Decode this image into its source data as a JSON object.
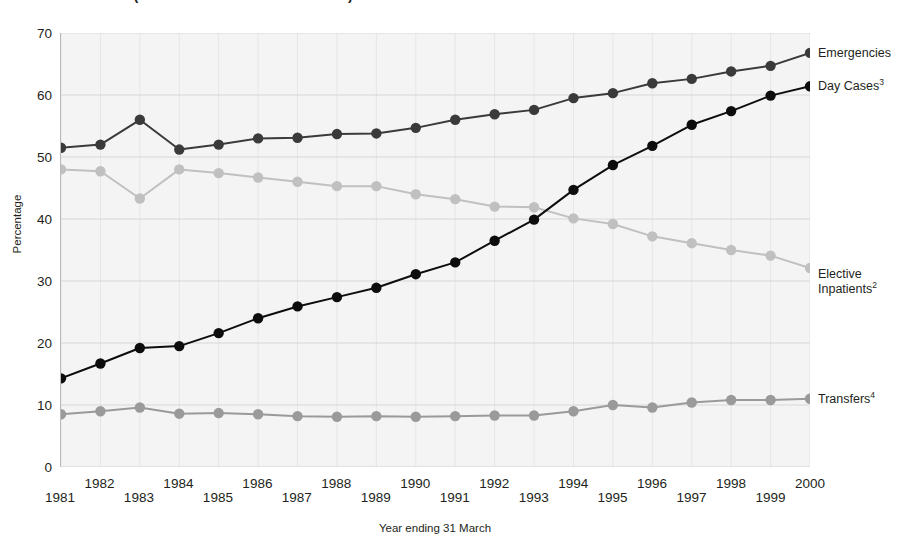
{
  "chart_data": {
    "type": "line",
    "title": "1981–2000 (NHSScotland – SMR1 & SMR4)",
    "xlabel": "Year ending 31 March",
    "ylabel": "Percentage",
    "ylim": [
      0,
      70
    ],
    "ytick_step": 10,
    "yticks": [
      0,
      10,
      20,
      30,
      40,
      50,
      60,
      70
    ],
    "grid": true,
    "legend_position": "right-inline",
    "categories": [
      "1981",
      "1982",
      "1983",
      "1984",
      "1985",
      "1986",
      "1987",
      "1988",
      "1989",
      "1990",
      "1991",
      "1992",
      "1993",
      "1994",
      "1995",
      "1996",
      "1997",
      "1998",
      "1999",
      "2000"
    ],
    "series": [
      {
        "name": "Emergencies",
        "label": "Emergencies",
        "superscript": "",
        "color": "#3a3a3a",
        "values": [
          51.5,
          52.0,
          56.0,
          51.2,
          52.0,
          53.0,
          53.1,
          53.7,
          53.8,
          54.7,
          56.0,
          56.9,
          57.6,
          59.5,
          60.3,
          61.9,
          62.6,
          63.8,
          64.7,
          66.8
        ]
      },
      {
        "name": "Day Cases",
        "label": "Day Cases",
        "superscript": "3",
        "color": "#0d0d0d",
        "values": [
          14.3,
          16.7,
          19.2,
          19.5,
          21.6,
          24.0,
          25.9,
          27.4,
          28.9,
          31.1,
          33.0,
          36.5,
          39.9,
          44.7,
          48.7,
          51.8,
          55.2,
          57.4,
          59.9,
          61.4
        ]
      },
      {
        "name": "Elective Inpatients",
        "label": "Elective Inpatients",
        "superscript": "2",
        "color": "#c0c0c0",
        "values": [
          48.0,
          47.7,
          43.3,
          48.0,
          47.4,
          46.7,
          46.0,
          45.3,
          45.3,
          44.0,
          43.2,
          42.0,
          41.9,
          40.1,
          39.2,
          37.2,
          36.1,
          35.0,
          34.1,
          32.1
        ]
      },
      {
        "name": "Transfers",
        "label": "Transfers",
        "superscript": "4",
        "color": "#9a9a9a",
        "values": [
          8.5,
          9.0,
          9.6,
          8.6,
          8.7,
          8.5,
          8.2,
          8.1,
          8.2,
          8.1,
          8.2,
          8.3,
          8.3,
          9.0,
          10.0,
          9.6,
          10.4,
          10.8,
          10.8,
          11.0
        ]
      }
    ]
  },
  "axis": {
    "y_title": "Percentage",
    "x_title": "Year ending 31 March"
  }
}
